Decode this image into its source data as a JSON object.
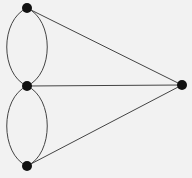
{
  "diagram": {
    "type": "multigraph",
    "background": "#f2f2f2",
    "edge_color": "#444444",
    "node_color": "#111111",
    "nodes": [
      {
        "id": "A",
        "x": 27,
        "y": 8
      },
      {
        "id": "B",
        "x": 27,
        "y": 86
      },
      {
        "id": "C",
        "x": 27,
        "y": 166
      },
      {
        "id": "D",
        "x": 182,
        "y": 85
      }
    ],
    "edges": [
      {
        "from": "A",
        "to": "B",
        "kind": "curve-left"
      },
      {
        "from": "A",
        "to": "B",
        "kind": "curve-right"
      },
      {
        "from": "B",
        "to": "C",
        "kind": "curve-left"
      },
      {
        "from": "B",
        "to": "C",
        "kind": "curve-right"
      },
      {
        "from": "A",
        "to": "D",
        "kind": "straight"
      },
      {
        "from": "B",
        "to": "D",
        "kind": "straight"
      },
      {
        "from": "C",
        "to": "D",
        "kind": "straight"
      }
    ]
  }
}
